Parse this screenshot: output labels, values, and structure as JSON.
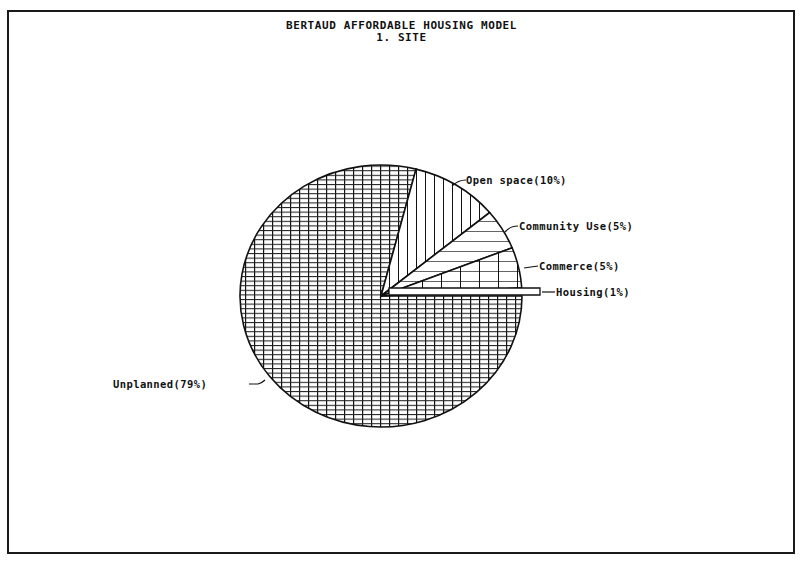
{
  "chart_data": {
    "type": "pie",
    "title": "BERTAUD AFFORDABLE HOUSING MODEL",
    "subtitle": "1. SITE",
    "slices": [
      {
        "label": "Housing(1%)",
        "name": "Housing",
        "value": 1,
        "pattern": "empty",
        "exploded": true
      },
      {
        "label": "Commerce(5%)",
        "name": "Commerce",
        "value": 5,
        "pattern": "wide-grid"
      },
      {
        "label": "Community Use(5%)",
        "name": "Community Use",
        "value": 5,
        "pattern": "horizontal-lines"
      },
      {
        "label": "Open space(10%)",
        "name": "Open space",
        "value": 10,
        "pattern": "vertical-lines"
      },
      {
        "label": "Unplanned(79%)",
        "name": "Unplanned",
        "value": 79,
        "pattern": "dense-grid"
      }
    ],
    "start_angle_deg": 0,
    "direction": "counterclockwise",
    "legend": "none (leader-line labels)",
    "colors": {
      "ink": "#111111",
      "background": "#ffffff"
    }
  }
}
